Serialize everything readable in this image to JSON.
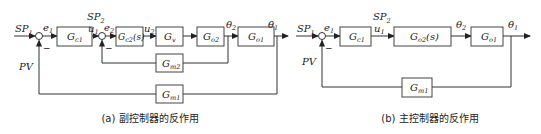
{
  "diagram_a": {
    "caption": "(a) 副控制器的反作用",
    "inputs": {
      "sp1": "SP",
      "sp1_sub": "1",
      "sp2": "SP",
      "sp2_sub": "2",
      "pv": "PV"
    },
    "signals": {
      "e1": "e",
      "e1_sub": "1",
      "u1": "u",
      "u1_sub": "1",
      "e2": "e",
      "e2_sub": "2",
      "u2": "u",
      "u2_sub": "2",
      "theta2": "θ",
      "theta2_sub": "2",
      "theta1": "θ",
      "theta1_sub": "1",
      "minus": "–"
    },
    "blocks": {
      "gc1": {
        "main": "G",
        "sub": "c1"
      },
      "gc2": {
        "main": "G",
        "sub": "c2",
        "suffix": "(s)"
      },
      "gv": {
        "main": "G",
        "sub": "v"
      },
      "go2": {
        "main": "G",
        "sub": "o2"
      },
      "go1": {
        "main": "G",
        "sub": "o1"
      },
      "gm2": {
        "main": "G",
        "sub": "m2"
      },
      "gm1": {
        "main": "G",
        "sub": "m1"
      }
    }
  },
  "diagram_b": {
    "caption": "(b) 主控制器的反作用",
    "inputs": {
      "sp1": "SP",
      "sp1_sub": "1",
      "sp2": "SP",
      "sp2_sub": "2",
      "pv": "PV"
    },
    "signals": {
      "e1": "e",
      "e1_sub": "1",
      "u1": "u",
      "u1_sub": "1",
      "theta2": "θ",
      "theta2_sub": "2",
      "theta1": "θ",
      "theta1_sub": "1",
      "minus": "–"
    },
    "blocks": {
      "gc1": {
        "main": "G",
        "sub": "c1"
      },
      "go2": {
        "main": "G",
        "sub": "o2",
        "suffix": "(s)"
      },
      "go1": {
        "main": "G",
        "sub": "o1"
      },
      "gm1": {
        "main": "G",
        "sub": "m1"
      }
    }
  }
}
